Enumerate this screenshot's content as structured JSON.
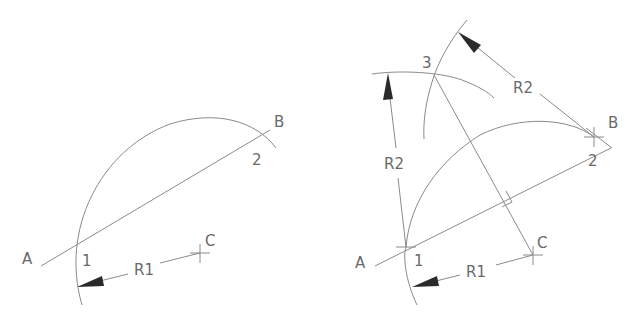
{
  "diagrams": [
    {
      "name": "step-1",
      "labels": {
        "A": "A",
        "B": "B",
        "C": "C",
        "p1": "1",
        "p2": "2",
        "r1": "R1"
      }
    },
    {
      "name": "step-2",
      "labels": {
        "A": "A",
        "B": "B",
        "C": "C",
        "p1": "1",
        "p2": "2",
        "p3": "3",
        "r1": "R1",
        "r2_left": "R2",
        "r2_right": "R2"
      }
    }
  ],
  "colors": {
    "line": "#8a8a8a",
    "arrow": "#2a2a2a",
    "text": "#6a6a6a",
    "background": "#ffffff"
  }
}
